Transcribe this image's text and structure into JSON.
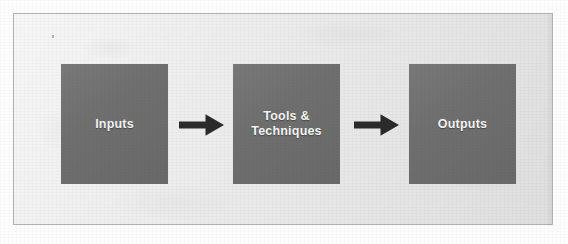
{
  "figure": {
    "kind": "process-flow-diagram",
    "orientation": "horizontal",
    "panel": {
      "background_color": "#ececec",
      "border_color": "#b2b2b2"
    },
    "box_fill_color": "#6e6e6e",
    "box_text_color": "#f4f4f4",
    "arrow_color": "#2b2b2b",
    "page_background_color": "#ffffff",
    "steps": [
      {
        "id": "inputs",
        "label": "Inputs",
        "name": "process-box-inputs"
      },
      {
        "id": "tools-techniques",
        "label": "Tools &\nTechniques",
        "name": "process-box-tools-techniques"
      },
      {
        "id": "outputs",
        "label": "Outputs",
        "name": "process-box-outputs"
      }
    ],
    "connectors": [
      {
        "id": "inputs-to-tools",
        "icon": "arrow-right-icon",
        "from": "inputs",
        "to": "tools-techniques"
      },
      {
        "id": "tools-to-outputs",
        "icon": "arrow-right-icon",
        "from": "tools-techniques",
        "to": "outputs"
      }
    ]
  }
}
